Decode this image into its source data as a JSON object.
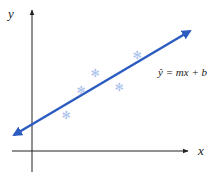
{
  "diagram": {
    "x_axis_label": "x",
    "y_axis_label": "y",
    "equation": "ŷ = mx + b",
    "colors": {
      "line": "#2d5cc0",
      "points": "#a9c1ea",
      "axes": "#222222"
    },
    "points": [
      {
        "x": 66,
        "y": 115
      },
      {
        "x": 81,
        "y": 90
      },
      {
        "x": 95,
        "y": 73
      },
      {
        "x": 119,
        "y": 87
      },
      {
        "x": 137,
        "y": 55
      }
    ],
    "point_glyph": "✻"
  }
}
